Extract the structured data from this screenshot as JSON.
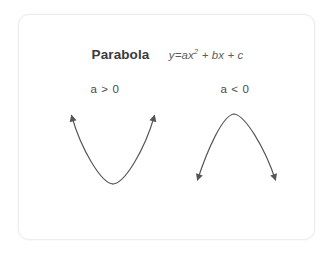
{
  "canvas": {
    "width": 333,
    "height": 255,
    "background_color": "#ffffff"
  },
  "card": {
    "background_color": "#ffffff",
    "border_color": "#ededed",
    "corner_radius": "11px"
  },
  "heading": {
    "title": "Parabola",
    "equation_prefix": "y=ax",
    "equation_exponent": "2",
    "equation_suffix": " + bx + c",
    "equation_full": "y=ax² + bx + c",
    "title_color": "#3b3b3b",
    "equation_color": "#5d5d5d"
  },
  "diagrams": [
    {
      "id": "upward-parabola",
      "condition_label": "a > 0",
      "opens": "up",
      "vertex": {
        "x": 94,
        "y": 169
      },
      "arrow_tips": [
        {
          "x": 50,
          "y": 96
        },
        {
          "x": 138,
          "y": 96
        }
      ],
      "stroke_color": "#555555"
    },
    {
      "id": "downward-parabola",
      "condition_label": "a < 0",
      "opens": "down",
      "vertex": {
        "x": 215,
        "y": 99
      },
      "arrow_tips": [
        {
          "x": 176,
          "y": 170
        },
        {
          "x": 259,
          "y": 170
        }
      ],
      "stroke_color": "#555555"
    }
  ],
  "colors": {
    "curve": "#555555",
    "text_primary": "#3b3b3b",
    "text_secondary": "#4a4a4a",
    "border": "#ededed"
  }
}
